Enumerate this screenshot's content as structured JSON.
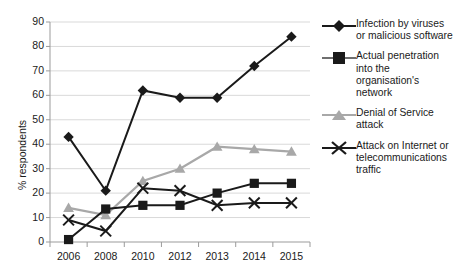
{
  "chart_data": {
    "type": "line",
    "title": "",
    "xlabel": "",
    "ylabel": "% respondents",
    "categories": [
      "2006",
      "2008",
      "2010",
      "2012",
      "2013",
      "2014",
      "2015"
    ],
    "ylim": [
      0,
      90
    ],
    "ytick_step": 10,
    "yticks": [
      "0",
      "10",
      "20",
      "30",
      "40",
      "50",
      "60",
      "70",
      "80",
      "90"
    ],
    "grid": true,
    "legend_position": "right",
    "series": [
      {
        "name": "Infection by viruses or malicious software",
        "marker": "diamond",
        "color": "#1a1a1a",
        "values": [
          43,
          21,
          62,
          59,
          59,
          72,
          84
        ]
      },
      {
        "name": "Actual penetration into the organisation's network",
        "marker": "square",
        "color": "#1a1a1a",
        "values": [
          1,
          13.5,
          15,
          15,
          20,
          24,
          24
        ]
      },
      {
        "name": "Denial of Service attack",
        "marker": "triangle",
        "color": "#a8a8a8",
        "values": [
          14,
          11,
          25,
          30,
          39,
          38,
          37
        ]
      },
      {
        "name": "Attack on Internet or telecommunications traffic",
        "marker": "cross",
        "color": "#1a1a1a",
        "values": [
          9,
          4.5,
          22,
          21,
          15,
          16,
          16
        ]
      }
    ]
  },
  "legend": {
    "items": [
      {
        "label": "Infection by viruses or malicious software",
        "marker": "diamond",
        "color": "#1a1a1a"
      },
      {
        "label": "Actual penetration into the organisation's network",
        "marker": "square",
        "color": "#1a1a1a"
      },
      {
        "label": "Denial of Service attack",
        "marker": "triangle",
        "color": "#a8a8a8"
      },
      {
        "label": "Attack on Internet or telecommunications traffic",
        "marker": "cross",
        "color": "#1a1a1a"
      }
    ]
  },
  "colors": {
    "axis": "#9b9b9b",
    "grid": "#d9d9d9",
    "text": "#1a1a1a",
    "gray_series": "#a8a8a8",
    "black_series": "#1a1a1a",
    "background": "#ffffff"
  }
}
